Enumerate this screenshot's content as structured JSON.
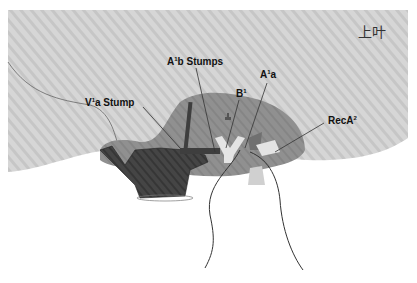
{
  "diagram": {
    "title_region_label": "上叶",
    "labels": {
      "v1a_stump": {
        "base": "V",
        "sup": "1",
        "rest": "a Stump"
      },
      "a1b_stumps": {
        "base": "A",
        "sup": "1",
        "rest": "b Stumps"
      },
      "b1": {
        "base": "B",
        "sup": "1",
        "rest": ""
      },
      "a1a": {
        "base": "A",
        "sup": "1",
        "rest": "a"
      },
      "reca2": {
        "base": "RecA",
        "sup": "2",
        "rest": ""
      }
    },
    "colors": {
      "lung_light": "#d4d4d4",
      "lung_stripe": "#c4c4c4",
      "hilum_mid": "#8e8e8e",
      "vein_dark": "#3e3e3e",
      "bronchus_light": "#e6e6e6",
      "line": "#333333"
    }
  }
}
